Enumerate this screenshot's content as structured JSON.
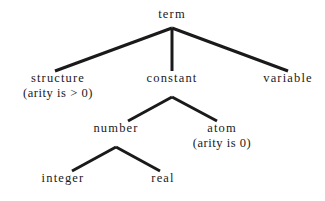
{
  "diagram": {
    "title": "term",
    "type": "taxonomy-tree",
    "background_color": "#ffffff",
    "line_color": "#1a1a1a",
    "text_color": "#1a1a1a",
    "nodes": [
      {
        "id": "term",
        "label": "term",
        "sublabel": "",
        "x": 172,
        "y": 8,
        "level": 0
      },
      {
        "id": "structure",
        "label": "structure",
        "sublabel": "(arity is > 0)",
        "x": 58,
        "y": 72,
        "level": 1
      },
      {
        "id": "constant",
        "label": "constant",
        "sublabel": "",
        "x": 172,
        "y": 72,
        "level": 1
      },
      {
        "id": "variable",
        "label": "variable",
        "sublabel": "",
        "x": 288,
        "y": 72,
        "level": 1
      },
      {
        "id": "number",
        "label": "number",
        "sublabel": "",
        "x": 116,
        "y": 122,
        "level": 2
      },
      {
        "id": "atom",
        "label": "atom",
        "sublabel": "(arity is 0)",
        "x": 222,
        "y": 122,
        "level": 2
      },
      {
        "id": "integer",
        "label": "integer",
        "sublabel": "",
        "x": 63,
        "y": 172,
        "level": 3
      },
      {
        "id": "real",
        "label": "real",
        "sublabel": "",
        "x": 163,
        "y": 172,
        "level": 3
      }
    ],
    "edges": [
      {
        "id": "term-structure",
        "from": "term",
        "to": "structure",
        "x1": 172,
        "y1": 28,
        "x2": 55,
        "y2": 71
      },
      {
        "id": "term-constant",
        "from": "term",
        "to": "constant",
        "x1": 172,
        "y1": 28,
        "x2": 172,
        "y2": 71
      },
      {
        "id": "term-variable",
        "from": "term",
        "to": "variable",
        "x1": 172,
        "y1": 28,
        "x2": 288,
        "y2": 71
      },
      {
        "id": "constant-number",
        "from": "constant",
        "to": "number",
        "x1": 172,
        "y1": 97,
        "x2": 128,
        "y2": 121
      },
      {
        "id": "constant-atom",
        "from": "constant",
        "to": "atom",
        "x1": 172,
        "y1": 97,
        "x2": 217,
        "y2": 121
      },
      {
        "id": "number-integer",
        "from": "number",
        "to": "integer",
        "x1": 116,
        "y1": 147,
        "x2": 72,
        "y2": 171
      },
      {
        "id": "number-real",
        "from": "number",
        "to": "real",
        "x1": 116,
        "y1": 147,
        "x2": 160,
        "y2": 171
      }
    ],
    "line_width": 3
  }
}
